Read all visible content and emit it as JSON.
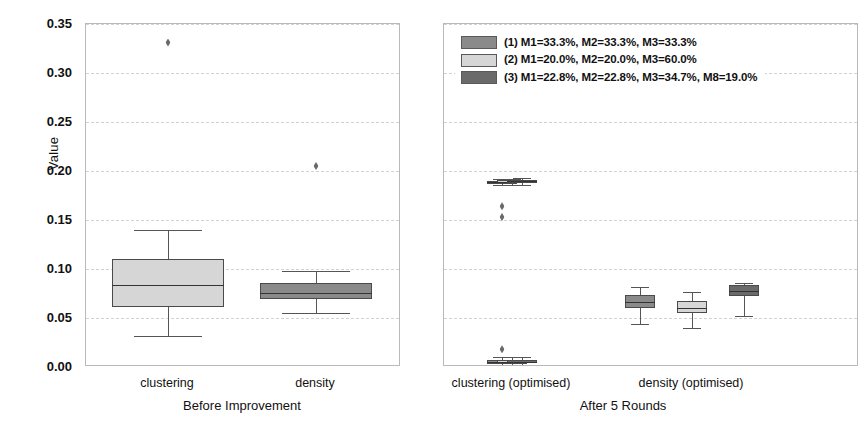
{
  "axis": {
    "ylabel": "Value",
    "yticks": [
      "0.00",
      "0.05",
      "0.10",
      "0.15",
      "0.20",
      "0.25",
      "0.30",
      "0.35"
    ]
  },
  "legend": {
    "items": [
      {
        "label": "(1) M1=33.3%, M2=33.3%, M3=33.3%",
        "color": "#8a8a8a"
      },
      {
        "label": "(2) M1=20.0%, M2=20.0%, M3=60.0%",
        "color": "#d6d6d6"
      },
      {
        "label": "(3) M1=22.8%, M2=22.8%, M3=34.7%, M8=19.0%",
        "color": "#6a6a6a"
      }
    ]
  },
  "panels": {
    "left": {
      "title": "Before Improvement",
      "groups": [
        "clustering",
        "density"
      ]
    },
    "right": {
      "title": "After 5 Rounds",
      "groups": [
        "clustering (optimised)",
        "density (optimised)"
      ]
    }
  },
  "chart_data": {
    "type": "box",
    "title": "",
    "xlabel": "",
    "ylabel": "Value",
    "ylim": [
      0.0,
      0.35
    ],
    "yticks": [
      0.0,
      0.05,
      0.1,
      0.15,
      0.2,
      0.25,
      0.3,
      0.35
    ],
    "grid": "horizontal-dashed",
    "legend_position": "top-center-right-panel",
    "series": [
      {
        "name": "(1) M1=33.3%, M2=33.3%, M3=33.3%",
        "color": "#8a8a8a"
      },
      {
        "name": "(2) M1=20.0%, M2=20.0%, M3=60.0%",
        "color": "#d6d6d6"
      },
      {
        "name": "(3) M1=22.8%, M2=22.8%, M3=34.7%, M8=19.0%",
        "color": "#6a6a6a"
      }
    ],
    "panels": [
      {
        "name": "Before Improvement",
        "groups": [
          {
            "name": "clustering",
            "boxes": [
              {
                "series": "(2) M1=20.0%, M2=20.0%, M3=60.0%",
                "color": "#d6d6d6",
                "whislo": 0.032,
                "q1": 0.061,
                "med": 0.084,
                "q3": 0.11,
                "whishi": 0.14,
                "fliers": [
                  0.331
                ]
              }
            ]
          },
          {
            "name": "density",
            "boxes": [
              {
                "series": "(1) M1=33.3%, M2=33.3%, M3=33.3%",
                "color": "#8a8a8a",
                "whislo": 0.055,
                "q1": 0.069,
                "med": 0.076,
                "q3": 0.086,
                "whishi": 0.098,
                "fliers": [
                  0.205
                ]
              }
            ]
          }
        ]
      },
      {
        "name": "After 5 Rounds",
        "groups": [
          {
            "name": "clustering (optimised)",
            "boxes": [
              {
                "series": "(1) M1=33.3%, M2=33.3%, M3=33.3%",
                "color": "#8a8a8a",
                "whislo": 0.186,
                "q1": 0.187,
                "med": 0.189,
                "q3": 0.19,
                "whishi": 0.192,
                "fliers": [
                  0.164,
                  0.153
                ]
              },
              {
                "series": "(2) M1=20.0%, M2=20.0%, M3=60.0%",
                "color": "#d6d6d6",
                "whislo": 0.186,
                "q1": 0.188,
                "med": 0.189,
                "q3": 0.191,
                "whishi": 0.192,
                "fliers": []
              },
              {
                "series": "(3) M1=22.8%, M2=22.8%, M3=34.7%, M8=19.0%",
                "color": "#6a6a6a",
                "whislo": 0.186,
                "q1": 0.188,
                "med": 0.19,
                "q3": 0.191,
                "whishi": 0.193,
                "fliers": []
              }
            ]
          },
          {
            "name": "clustering (optimised) near-zero",
            "boxes": [
              {
                "series": "(1) M1=33.3%, M2=33.3%, M3=33.3%",
                "color": "#8a8a8a",
                "whislo": 0.002,
                "q1": 0.003,
                "med": 0.005,
                "q3": 0.007,
                "whishi": 0.01,
                "fliers": [
                  0.018
                ]
              },
              {
                "series": "(2) M1=20.0%, M2=20.0%, M3=60.0%",
                "color": "#d6d6d6",
                "whislo": 0.002,
                "q1": 0.003,
                "med": 0.005,
                "q3": 0.007,
                "whishi": 0.01,
                "fliers": []
              },
              {
                "series": "(3) M1=22.8%, M2=22.8%, M3=34.7%, M8=19.0%",
                "color": "#6a6a6a",
                "whislo": 0.002,
                "q1": 0.004,
                "med": 0.005,
                "q3": 0.007,
                "whishi": 0.01,
                "fliers": []
              }
            ]
          },
          {
            "name": "density (optimised)",
            "boxes": [
              {
                "series": "(1) M1=33.3%, M2=33.3%, M3=33.3%",
                "color": "#8a8a8a",
                "whislo": 0.044,
                "q1": 0.06,
                "med": 0.066,
                "q3": 0.073,
                "whishi": 0.082,
                "fliers": []
              },
              {
                "series": "(2) M1=20.0%, M2=20.0%, M3=60.0%",
                "color": "#d6d6d6",
                "whislo": 0.04,
                "q1": 0.055,
                "med": 0.06,
                "q3": 0.067,
                "whishi": 0.077,
                "fliers": []
              },
              {
                "series": "(3) M1=22.8%, M2=22.8%, M3=34.7%, M8=19.0%",
                "color": "#6a6a6a",
                "whislo": 0.052,
                "q1": 0.072,
                "med": 0.078,
                "q3": 0.084,
                "whishi": 0.086,
                "fliers": []
              }
            ]
          }
        ]
      }
    ]
  }
}
